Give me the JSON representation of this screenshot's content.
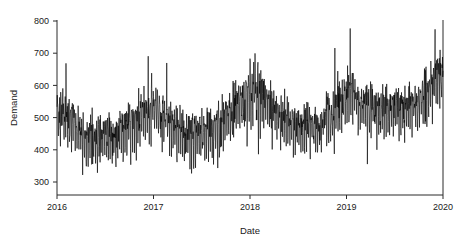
{
  "chart_data": {
    "type": "line",
    "title": "",
    "xlabel": "Date",
    "ylabel": "Demand",
    "grid": false,
    "legend": null,
    "xlim": [
      2016.0,
      2020.0
    ],
    "ylim": [
      270,
      800
    ],
    "x_tick_labels": [
      "2016",
      "2017",
      "2018",
      "2019",
      "2020"
    ],
    "x_tick_values": [
      2016,
      2017,
      2018,
      2019,
      2020
    ],
    "y_tick_labels": [
      "300",
      "400",
      "500",
      "600",
      "700",
      "800"
    ],
    "y_tick_values": [
      300,
      400,
      500,
      600,
      700,
      800
    ],
    "series_name": "Demand",
    "line_color": "#000000",
    "frequency": "daily",
    "n_points": 1461,
    "summary": {
      "min": 275,
      "max": 782,
      "mean": 516,
      "start_value": 470,
      "end_value": 610
    },
    "annual_baseline": [
      {
        "year": 2016,
        "baseline": 483,
        "peak": 637,
        "trough": 327
      },
      {
        "year": 2017,
        "baseline": 487,
        "peak": 662,
        "trough": 334
      },
      {
        "year": 2018,
        "baseline": 516,
        "peak": 782,
        "trough": 352
      },
      {
        "year": 2019,
        "baseline": 545,
        "peak": 765,
        "trough": 275
      },
      {
        "year": 2020,
        "baseline": 600,
        "peak": 762,
        "trough": 470
      }
    ],
    "trend_knots_x": [
      2016.0,
      2016.35,
      2016.7,
      2017.0,
      2017.4,
      2017.95,
      2018.1,
      2018.5,
      2018.85,
      2019.0,
      2019.45,
      2019.8,
      2020.0
    ],
    "trend_knots_y": [
      487,
      462,
      487,
      492,
      478,
      540,
      562,
      505,
      492,
      530,
      552,
      572,
      600
    ],
    "x": [
      2016.0,
      2016.25,
      2016.5,
      2016.75,
      2017.0,
      2017.25,
      2017.5,
      2017.75,
      2018.0,
      2018.25,
      2018.5,
      2018.75,
      2019.0,
      2019.25,
      2019.5,
      2019.75,
      2020.0
    ],
    "y": [
      487,
      465,
      480,
      492,
      495,
      478,
      484,
      505,
      562,
      545,
      505,
      495,
      532,
      545,
      560,
      575,
      600
    ]
  },
  "axes": {
    "y_title": "Demand",
    "x_title": "Date"
  }
}
